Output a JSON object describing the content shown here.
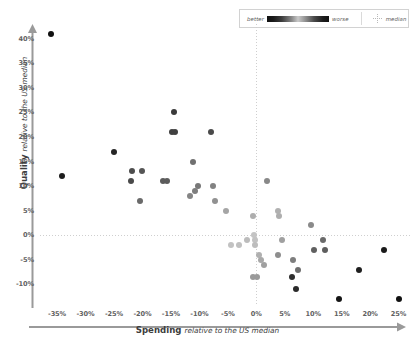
{
  "legend": {
    "better_label": "better",
    "worse_label": "worse",
    "median_label": "median",
    "gradient_dark": "#111111",
    "gradient_light": "#c9c9c9",
    "median_line_color": "#cfcfcf"
  },
  "axes": {
    "y_title_bold": "Quality",
    "y_title_italic": "relative to the US median",
    "x_title_bold": "Spending",
    "x_title_italic": "relative to the US median",
    "y_ticks": [
      "40%",
      "35%",
      "30%",
      "25%",
      "20%",
      "15%",
      "10%",
      "5%",
      "0%",
      "-5%",
      "-10%"
    ],
    "x_ticks": [
      "-35%",
      "-30%",
      "-25%",
      "-20%",
      "-15%",
      "-10%",
      "-5%",
      "0%",
      "5%",
      "10%",
      "15%",
      "20%",
      "25%"
    ]
  },
  "chart_data": {
    "type": "scatter",
    "title": "",
    "xlabel": "Spending relative to the US median",
    "ylabel": "Quality relative to the US median",
    "xlim": [
      -38,
      27
    ],
    "ylim": [
      -14,
      43
    ],
    "x_ticks": [
      -35,
      -30,
      -25,
      -20,
      -15,
      -10,
      -5,
      0,
      5,
      10,
      15,
      20,
      25
    ],
    "y_ticks": [
      -10,
      -5,
      0,
      5,
      10,
      15,
      20,
      25,
      30,
      35,
      40
    ],
    "grid": false,
    "legend_position": "top-right",
    "median_lines": {
      "x": 0,
      "y": 0
    },
    "color_encoding": "darkness = distance from median (dark = better or worse extreme, light = near median)",
    "points": [
      {
        "x": -36.0,
        "y": 41.0,
        "shade": "#111111"
      },
      {
        "x": -34.2,
        "y": 12.0,
        "shade": "#1d1d1d"
      },
      {
        "x": -25.0,
        "y": 17.0,
        "shade": "#262626"
      },
      {
        "x": -21.8,
        "y": 13.0,
        "shade": "#4d4d4d"
      },
      {
        "x": -20.0,
        "y": 13.0,
        "shade": "#555555"
      },
      {
        "x": -22.0,
        "y": 11.0,
        "shade": "#4a4a4a"
      },
      {
        "x": -20.4,
        "y": 7.0,
        "shade": "#6a6a6a"
      },
      {
        "x": -16.4,
        "y": 11.0,
        "shade": "#5c5c5c"
      },
      {
        "x": -15.7,
        "y": 11.0,
        "shade": "#5c5c5c"
      },
      {
        "x": -14.4,
        "y": 25.0,
        "shade": "#3a3a3a"
      },
      {
        "x": -14.8,
        "y": 21.0,
        "shade": "#404040"
      },
      {
        "x": -14.2,
        "y": 21.0,
        "shade": "#404040"
      },
      {
        "x": -11.2,
        "y": 15.0,
        "shade": "#707070"
      },
      {
        "x": -11.6,
        "y": 8.0,
        "shade": "#858585"
      },
      {
        "x": -10.8,
        "y": 9.0,
        "shade": "#7e7e7e"
      },
      {
        "x": -10.2,
        "y": 10.0,
        "shade": "#787878"
      },
      {
        "x": -8.0,
        "y": 21.0,
        "shade": "#4a4a4a"
      },
      {
        "x": -7.6,
        "y": 10.0,
        "shade": "#828282"
      },
      {
        "x": -7.2,
        "y": 7.0,
        "shade": "#919191"
      },
      {
        "x": -5.4,
        "y": 5.0,
        "shade": "#a5a5a5"
      },
      {
        "x": -4.4,
        "y": -2.0,
        "shade": "#c2c2c2"
      },
      {
        "x": -3.0,
        "y": -2.0,
        "shade": "#c0c0c0"
      },
      {
        "x": -1.6,
        "y": -1.0,
        "shade": "#bcbcbc"
      },
      {
        "x": -0.6,
        "y": 4.0,
        "shade": "#aeaeae"
      },
      {
        "x": -0.4,
        "y": 0.0,
        "shade": "#c4c4c4"
      },
      {
        "x": -0.3,
        "y": -1.0,
        "shade": "#c2c2c2"
      },
      {
        "x": -0.2,
        "y": -2.0,
        "shade": "#bdbdbd"
      },
      {
        "x": 0.4,
        "y": -4.0,
        "shade": "#b0b0b0"
      },
      {
        "x": 0.8,
        "y": -5.0,
        "shade": "#a8a8a8"
      },
      {
        "x": 1.4,
        "y": -6.0,
        "shade": "#a0a0a0"
      },
      {
        "x": -0.5,
        "y": -8.5,
        "shade": "#9a9a9a"
      },
      {
        "x": 0.1,
        "y": -8.5,
        "shade": "#9a9a9a"
      },
      {
        "x": 1.8,
        "y": 11.0,
        "shade": "#888888"
      },
      {
        "x": 3.8,
        "y": 5.0,
        "shade": "#b0b0b0"
      },
      {
        "x": 4.0,
        "y": 4.0,
        "shade": "#aeaeae"
      },
      {
        "x": 4.6,
        "y": -1.0,
        "shade": "#a0a0a0"
      },
      {
        "x": 3.8,
        "y": -4.0,
        "shade": "#8e8e8e"
      },
      {
        "x": 6.4,
        "y": -5.0,
        "shade": "#7e7e7e"
      },
      {
        "x": 7.4,
        "y": -7.0,
        "shade": "#6e6e6e"
      },
      {
        "x": 6.2,
        "y": -8.5,
        "shade": "#2e2e2e"
      },
      {
        "x": 7.0,
        "y": -11.0,
        "shade": "#2a2a2a"
      },
      {
        "x": 9.6,
        "y": 2.0,
        "shade": "#8a8a8a"
      },
      {
        "x": 10.2,
        "y": -3.0,
        "shade": "#606060"
      },
      {
        "x": 11.8,
        "y": -1.0,
        "shade": "#6a6a6a"
      },
      {
        "x": 12.0,
        "y": -3.0,
        "shade": "#5e5e5e"
      },
      {
        "x": 14.6,
        "y": -13.0,
        "shade": "#151515"
      },
      {
        "x": 18.0,
        "y": -7.0,
        "shade": "#1f1f1f"
      },
      {
        "x": 22.4,
        "y": -3.0,
        "shade": "#1a1a1a"
      },
      {
        "x": 25.0,
        "y": -13.0,
        "shade": "#111111"
      }
    ]
  }
}
